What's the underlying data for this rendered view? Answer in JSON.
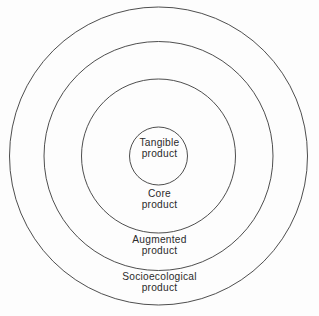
{
  "diagram": {
    "type": "concentric-circles",
    "background_color": "#fdfdfd",
    "stroke_color": "#3a3a3a",
    "text_color": "#2b2b2b",
    "center": {
      "x": 158.5,
      "y": 156
    },
    "rings": [
      {
        "id": "socioecological",
        "level": 4,
        "radius": 149,
        "label_line_1": "Socioecological",
        "label_line_2": "product"
      },
      {
        "id": "augmented",
        "level": 3,
        "radius": 114.5,
        "label_line_1": "Augmented",
        "label_line_2": "product"
      },
      {
        "id": "core",
        "level": 2,
        "radius": 77,
        "label_line_1": "Core",
        "label_line_2": "product"
      },
      {
        "id": "tangible",
        "level": 1,
        "radius": 29,
        "label_line_1": "Tangible",
        "label_line_2": "product"
      }
    ]
  },
  "chart_data": {
    "type": "pie",
    "title": "",
    "categories": [
      "Tangible product",
      "Core product",
      "Augmented product",
      "Socioecological product"
    ],
    "values": [
      29,
      77,
      114.5,
      149
    ],
    "xlabel": "",
    "ylabel": "",
    "legend_position": "none",
    "grid": false,
    "annotations": [
      "Tangible product",
      "Core product",
      "Augmented product",
      "Socioecological product"
    ]
  }
}
